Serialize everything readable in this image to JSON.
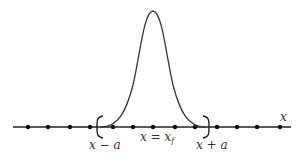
{
  "diagram": {
    "axis": {
      "label": "x",
      "color": "#222222"
    },
    "points_x": [
      28,
      48,
      70,
      90,
      113,
      133,
      153,
      175,
      195,
      217,
      237,
      257,
      280
    ],
    "brackets": {
      "left": "(",
      "right": ")"
    },
    "labels": {
      "left_bound": "x − a",
      "center": "x = x",
      "center_sub": "f",
      "right_bound": "x + a"
    },
    "curve": {
      "type": "gaussian-bump",
      "peak_x": 153,
      "peak_y": 11,
      "left_end_x": 101,
      "right_end_x": 205
    }
  }
}
